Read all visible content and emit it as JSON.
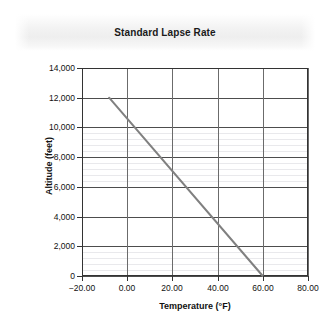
{
  "chart_data": {
    "type": "line",
    "title": "Standard Lapse Rate",
    "xlabel": "Temperature (°F)",
    "ylabel": "Altitude (feet)",
    "xlim": [
      -20,
      80
    ],
    "ylim": [
      0,
      14000
    ],
    "xticks": [
      "-20.00",
      "0.00",
      "20.00",
      "40.00",
      "60.00",
      "80.00"
    ],
    "xtick_values": [
      -20,
      0,
      20,
      40,
      60,
      80
    ],
    "yticks": [
      "0",
      "2,000",
      "4,000",
      "6,000",
      "8,000",
      "10,000",
      "12,000",
      "14,000"
    ],
    "ytick_values": [
      0,
      2000,
      4000,
      6000,
      8000,
      10000,
      12000,
      14000
    ],
    "grid": "major gridlines on both axes, faint minor horizontal gridlines",
    "legend": "none",
    "series": [
      {
        "name": "Standard Lapse Rate",
        "color": "#808080",
        "line_width": 2,
        "x": [
          -8,
          60
        ],
        "y": [
          12000,
          0
        ],
        "points": [
          {
            "temperature_f": -8,
            "altitude_ft": 12000
          },
          {
            "temperature_f": 0,
            "altitude_ft": 10600
          },
          {
            "temperature_f": 20,
            "altitude_ft": 7050
          },
          {
            "temperature_f": 40,
            "altitude_ft": 3550
          },
          {
            "temperature_f": 60,
            "altitude_ft": 0
          }
        ]
      }
    ]
  },
  "style": {
    "background": "#ffffff",
    "axis_color": "#333333",
    "major_grid_color": "#4d4d4d",
    "minor_grid_color": "#e9e9ec",
    "line_color": "#808080",
    "title_color": "#1a1a1a",
    "banner_color": "#eeeeee"
  }
}
